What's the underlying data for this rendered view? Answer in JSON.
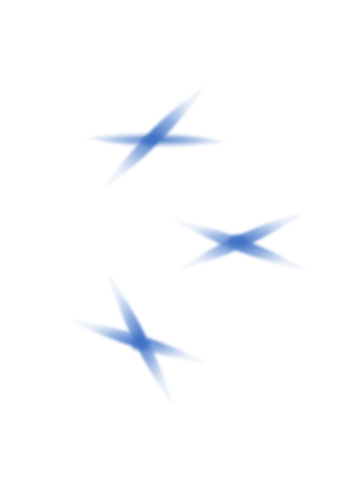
{
  "image": {
    "description": "Three soft blue watercolor-style X shapes on a white background",
    "background": "#ffffff",
    "colors": {
      "core": "#3a6fc4",
      "mid": "#6f97d6",
      "edge": "#c6d6ef"
    },
    "crosses": [
      {
        "name": "cross-top-left",
        "center": [
          150,
          140
        ],
        "arms": [
          {
            "from": [
              86,
              138
            ],
            "to": [
              226,
              142
            ],
            "width": 14
          },
          {
            "from": [
              205,
              86
            ],
            "to": [
              104,
              188
            ],
            "width": 14
          }
        ]
      },
      {
        "name": "cross-middle-right",
        "center": [
          237,
          240
        ],
        "arms": [
          {
            "from": [
              174,
              220
            ],
            "to": [
              306,
              270
            ],
            "width": 13
          },
          {
            "from": [
              178,
              270
            ],
            "to": [
              305,
              212
            ],
            "width": 13
          }
        ]
      },
      {
        "name": "cross-bottom-left",
        "center": [
          140,
          345
        ],
        "arms": [
          {
            "from": [
              70,
              320
            ],
            "to": [
              207,
              363
            ],
            "width": 13
          },
          {
            "from": [
              107,
              272
            ],
            "to": [
              173,
              405
            ],
            "width": 13
          }
        ]
      }
    ]
  }
}
